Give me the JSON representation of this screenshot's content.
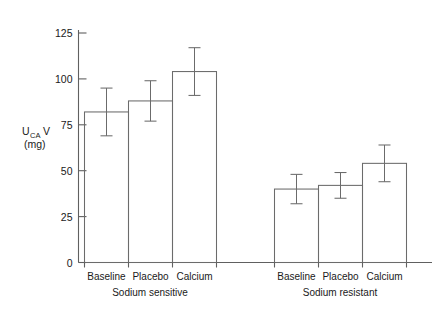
{
  "chart_data": {
    "type": "bar",
    "title": "",
    "xlabel": "",
    "ylabel": "UCAV (mg)",
    "ylabel_main": "U",
    "ylabel_sub": "CA",
    "ylabel_main2": "V",
    "ylabel_units": "(mg)",
    "ylim": [
      0,
      135
    ],
    "yticks": [
      0,
      25,
      50,
      75,
      100,
      125
    ],
    "ytick_labels": [
      "0",
      "25",
      "50",
      "75",
      "100",
      "125"
    ],
    "grid": false,
    "legend": "none",
    "categories": [
      "Baseline",
      "Placebo",
      "Calcium",
      "Baseline",
      "Placebo",
      "Calcium"
    ],
    "group_labels": [
      "Sodium sensitive",
      "Sodium resistant"
    ],
    "groups": [
      {
        "name": "Sodium sensitive",
        "bars": [
          {
            "label": "Baseline",
            "value": 82,
            "error": 13
          },
          {
            "label": "Placebo",
            "value": 88,
            "error": 11
          },
          {
            "label": "Calcium",
            "value": 104,
            "error": 13
          }
        ]
      },
      {
        "name": "Sodium resistant",
        "bars": [
          {
            "label": "Baseline",
            "value": 40,
            "error": 8
          },
          {
            "label": "Placebo",
            "value": 42,
            "error": 7
          },
          {
            "label": "Calcium",
            "value": 54,
            "error": 10
          }
        ]
      }
    ],
    "values": [
      82,
      88,
      104,
      40,
      42,
      54
    ],
    "errors": [
      13,
      11,
      13,
      8,
      7,
      10
    ],
    "colors": {
      "bar_stroke": "#6b6b6b",
      "axis": "#606060",
      "text": "#1a1a1a",
      "background": "#ffffff"
    }
  }
}
